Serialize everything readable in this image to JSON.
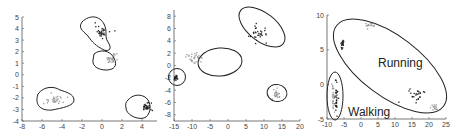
{
  "chart_data": [
    {
      "type": "scatter",
      "title": "",
      "xlabel": "",
      "ylabel": "",
      "xlim": [
        -8,
        5.5
      ],
      "ylim": [
        -4,
        5
      ],
      "xticks": [
        -8,
        -6,
        -4,
        -2,
        0,
        2,
        4
      ],
      "yticks": [
        -4,
        -3,
        -2,
        -1,
        0,
        1,
        2,
        3,
        4,
        5
      ],
      "grid": false,
      "clusters": [
        {
          "name": "cluster-1",
          "shade": "dark",
          "center": [
            0.0,
            3.7
          ],
          "spread": [
            0.6,
            0.5
          ],
          "n": 30
        },
        {
          "name": "cluster-2",
          "shade": "light",
          "center": [
            0.9,
            1.4
          ],
          "spread": [
            0.6,
            0.35
          ],
          "n": 28
        },
        {
          "name": "cluster-3",
          "shade": "light",
          "center": [
            -4.8,
            -2.2
          ],
          "spread": [
            1.0,
            0.35
          ],
          "n": 30
        },
        {
          "name": "cluster-4",
          "shade": "dark",
          "center": [
            4.4,
            -2.8
          ],
          "spread": [
            0.5,
            0.35
          ],
          "n": 30
        }
      ],
      "boundary": "irregular contours"
    },
    {
      "type": "scatter",
      "title": "",
      "xlabel": "",
      "ylabel": "",
      "xlim": [
        -15,
        20
      ],
      "ylim": [
        -9,
        9
      ],
      "xticks": [
        -15,
        -10,
        -5,
        0,
        5,
        10,
        15,
        20
      ],
      "yticks": [
        -8,
        -6,
        -4,
        -2,
        0,
        2,
        4,
        6,
        8
      ],
      "grid": false,
      "clusters": [
        {
          "name": "cluster-1",
          "shade": "dark",
          "center": [
            -14.5,
            -2
          ],
          "spread": [
            0.5,
            0.4
          ],
          "n": 25
        },
        {
          "name": "cluster-2",
          "shade": "light",
          "center": [
            -9,
            1.2
          ],
          "spread": [
            2.2,
            0.9
          ],
          "n": 30
        },
        {
          "name": "cluster-3",
          "shade": "dark",
          "center": [
            8.5,
            5.2
          ],
          "spread": [
            2.2,
            1.2
          ],
          "n": 30
        },
        {
          "name": "cluster-4",
          "shade": "light",
          "center": [
            13.5,
            -4.5
          ],
          "spread": [
            0.8,
            0.5
          ],
          "n": 25
        }
      ],
      "boundary": "ellipses"
    },
    {
      "type": "scatter",
      "title": "",
      "xlabel": "",
      "ylabel": "",
      "xlim": [
        -10,
        25
      ],
      "ylim": [
        -5,
        10
      ],
      "xticks": [
        -10,
        -5,
        0,
        5,
        10,
        15,
        20,
        25
      ],
      "yticks": [
        -5,
        0,
        5,
        10
      ],
      "grid": false,
      "annotations": [
        "Running",
        "Walking"
      ],
      "clusters": [
        {
          "name": "running-dark-top",
          "shade": "dark",
          "center": [
            -5.5,
            5.8
          ],
          "spread": [
            0.4,
            0.6
          ],
          "n": 20
        },
        {
          "name": "running-light-top",
          "shade": "light",
          "center": [
            2.5,
            8.5
          ],
          "spread": [
            1.5,
            0.4
          ],
          "n": 15
        },
        {
          "name": "running-dark-diag",
          "shade": "dark",
          "center": [
            17,
            -1.5
          ],
          "spread": [
            2.5,
            0.8
          ],
          "n": 25
        },
        {
          "name": "running-light-diag",
          "shade": "light",
          "center": [
            21.5,
            -3.3
          ],
          "spread": [
            1.0,
            0.5
          ],
          "n": 15
        },
        {
          "name": "walking-dark",
          "shade": "dark",
          "center": [
            -7.3,
            -1.8
          ],
          "spread": [
            0.4,
            2.2
          ],
          "n": 30
        },
        {
          "name": "walking-light",
          "shade": "light",
          "center": [
            -8.2,
            -2.2
          ],
          "spread": [
            0.4,
            1.8
          ],
          "n": 25
        }
      ],
      "boundary": "ellipses"
    }
  ]
}
